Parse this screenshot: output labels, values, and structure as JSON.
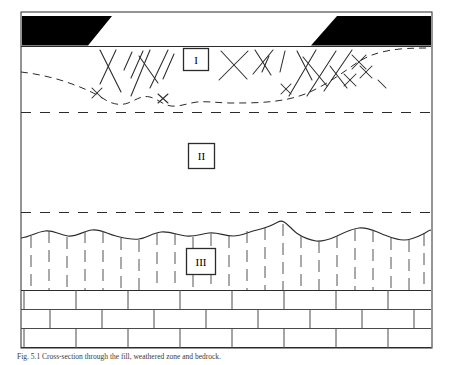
{
  "figure": {
    "caption": "Fig. 5.1 Cross-section through the fill, weathered zone and bedrock.",
    "frame": {
      "x": 21,
      "y": 12,
      "width": 411,
      "height": 336,
      "stroke": "#2b2b2b"
    },
    "colors": {
      "line": "#2b2b2b",
      "fill_black": "#000000",
      "hatch": "#2b2b2b",
      "background": "#ffffff"
    },
    "zones": [
      {
        "id": "zone-1",
        "label": "I",
        "label_box": {
          "x": 183,
          "y": 48,
          "width": 26,
          "height": 23
        },
        "description": "upper weathered / disturbed zone with cross-hatch X ornament bounded below by a dashed irregular base"
      },
      {
        "id": "zone-2",
        "label": "II",
        "label_box": {
          "x": 188,
          "y": 143,
          "width": 26,
          "height": 26
        },
        "description": "middle blank zone bounded by two horizontal dashed lines"
      },
      {
        "id": "zone-3",
        "label": "III",
        "label_box": {
          "x": 186,
          "y": 248,
          "width": 30,
          "height": 27
        },
        "description": "lower zone with short vertical dashes beneath a wavy upper boundary"
      }
    ],
    "dashed_horizons": [
      {
        "id": "horizon-upper",
        "y": 112
      },
      {
        "id": "horizon-lower",
        "y": 212
      }
    ],
    "surface": {
      "id": "ground-surface",
      "y": 47,
      "description": "horizontal ground surface line spanning the frame"
    },
    "black_masses": [
      {
        "id": "black-mass-left",
        "description": "left solid black trapezoid at the surface",
        "points": "23,16 112,16 88,45 23,45"
      },
      {
        "id": "black-mass-right",
        "description": "right solid black trapezoid at the surface",
        "points": "336,16 430,16 430,45 311,45"
      }
    ],
    "bedrock": {
      "id": "bedrock-brickwork",
      "top": 290,
      "bottom": 348,
      "rows": 3,
      "description": "bedrock drawn as a running-bond brick / blocky limestone ornament"
    }
  }
}
